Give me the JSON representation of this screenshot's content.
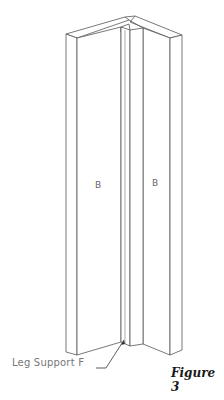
{
  "figure": {
    "caption": "Figure 3",
    "parts": {
      "left_board_label": "B",
      "right_board_label": "B"
    },
    "callout": {
      "label": "Leg Support F"
    },
    "colors": {
      "line": "#555555",
      "background": "#ffffff",
      "caption": "#1a1a1a"
    }
  }
}
